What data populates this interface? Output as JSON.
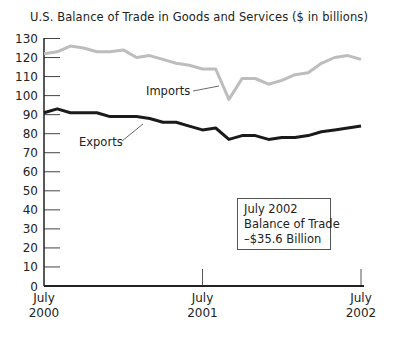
{
  "chart_data": {
    "type": "line",
    "title": "U.S. Balance of Trade in Goods and Services ($ in billions)",
    "xlabel": "",
    "ylabel": "",
    "ylim": [
      0,
      130
    ],
    "yticks": [
      0,
      10,
      20,
      30,
      40,
      50,
      60,
      70,
      80,
      90,
      100,
      110,
      120,
      130
    ],
    "xtick_labels": [
      {
        "line1": "July",
        "line2": "2000"
      },
      {
        "line1": "July",
        "line2": "2001"
      },
      {
        "line1": "July",
        "line2": "2002"
      }
    ],
    "grid": false,
    "x": [
      "Jul 2000",
      "Aug 2000",
      "Sep 2000",
      "Oct 2000",
      "Nov 2000",
      "Dec 2000",
      "Jan 2001",
      "Feb 2001",
      "Mar 2001",
      "Apr 2001",
      "May 2001",
      "Jun 2001",
      "Jul 2001",
      "Aug 2001",
      "Sep 2001",
      "Oct 2001",
      "Nov 2001",
      "Dec 2001",
      "Jan 2002",
      "Feb 2002",
      "Mar 2002",
      "Apr 2002",
      "May 2002",
      "Jun 2002",
      "Jul 2002"
    ],
    "series": [
      {
        "name": "Imports",
        "color": "#bdbdbd",
        "values": [
          122,
          123,
          126,
          125,
          123,
          123,
          124,
          120,
          121,
          119,
          117,
          116,
          114,
          114,
          98,
          109,
          109,
          106,
          108,
          111,
          112,
          117,
          120,
          121,
          119
        ]
      },
      {
        "name": "Exports",
        "color": "#1a1a1a",
        "values": [
          91,
          93,
          91,
          91,
          91,
          89,
          89,
          89,
          88,
          86,
          86,
          84,
          82,
          83,
          77,
          79,
          79,
          77,
          78,
          78,
          79,
          81,
          82,
          83,
          84
        ]
      }
    ],
    "annotations": [
      {
        "text": "Imports",
        "target_series": "Imports"
      },
      {
        "text": "Exports",
        "target_series": "Exports"
      },
      {
        "text": [
          "July 2002",
          "Balance of Trade",
          "–$35.6 Billion"
        ],
        "type": "box"
      }
    ]
  },
  "labels": {
    "imports": "Imports",
    "exports": "Exports",
    "note_line1": "July 2002",
    "note_line2": "Balance of Trade",
    "note_line3": "–$35.6 Billion"
  }
}
